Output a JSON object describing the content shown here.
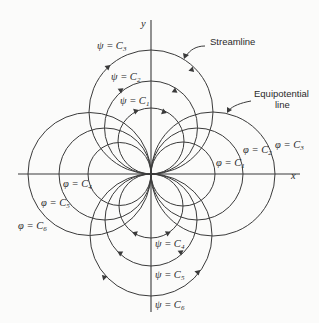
{
  "figure": {
    "axes": {
      "x_label": "x",
      "y_label": "y"
    },
    "callouts": {
      "streamline": "Streamline",
      "equipotential_line1": "Equipotential",
      "equipotential_line2": "line"
    },
    "streamline_labels": [
      {
        "sym": "ψ = C",
        "sub": "1"
      },
      {
        "sym": "ψ = C",
        "sub": "2"
      },
      {
        "sym": "ψ = C",
        "sub": "3"
      },
      {
        "sym": "ψ = C",
        "sub": "4"
      },
      {
        "sym": "ψ = C",
        "sub": "5"
      },
      {
        "sym": "ψ = C",
        "sub": "6"
      }
    ],
    "equipotential_labels": [
      {
        "sym": "φ = C",
        "sub": "1"
      },
      {
        "sym": "φ = C",
        "sub": "2"
      },
      {
        "sym": "φ = C",
        "sub": "3"
      },
      {
        "sym": "φ = C",
        "sub": "4"
      },
      {
        "sym": "φ = C",
        "sub": "5"
      },
      {
        "sym": "φ = C",
        "sub": "6"
      }
    ],
    "line_color": "#3a3a3a",
    "background": "#fbfbfa"
  }
}
